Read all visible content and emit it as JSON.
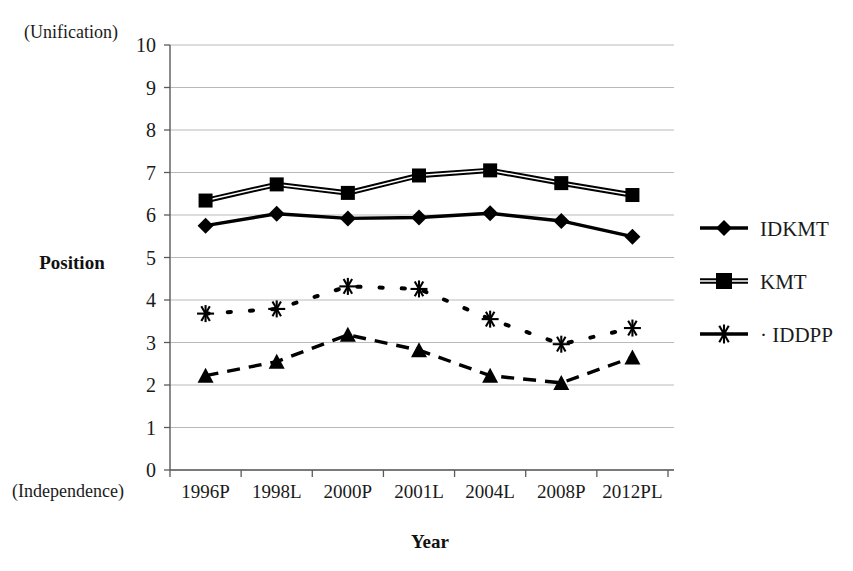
{
  "chart_data": {
    "type": "line",
    "title": "",
    "xlabel": "Year",
    "ylabel": "Position",
    "ylim": [
      0,
      10
    ],
    "ytick_step": 1,
    "grid": true,
    "legend_position": "right",
    "top_axis_note": "(Unification)",
    "bottom_axis_note": "(Independence)",
    "categories": [
      "1996P",
      "1998L",
      "2000P",
      "2001L",
      "2004L",
      "2008P",
      "2012PL"
    ],
    "yticks": [
      "0",
      "1",
      "2",
      "3",
      "4",
      "5",
      "6",
      "7",
      "8",
      "9",
      "10"
    ],
    "series": [
      {
        "name": "KMT",
        "marker": "square",
        "linestyle": "double-solid",
        "values": [
          6.34,
          6.72,
          6.52,
          6.93,
          7.05,
          6.75,
          6.47
        ]
      },
      {
        "name": "IDKMT",
        "marker": "diamond",
        "linestyle": "solid",
        "values": [
          5.75,
          6.03,
          5.92,
          5.94,
          6.04,
          5.86,
          5.49
        ]
      },
      {
        "name": "IDDPP",
        "marker": "star",
        "linestyle": "dotted",
        "values": [
          3.68,
          3.79,
          4.32,
          4.26,
          3.55,
          2.96,
          3.34
        ]
      },
      {
        "name": "DPP",
        "marker": "triangle",
        "linestyle": "dashed",
        "values": [
          2.22,
          2.55,
          3.18,
          2.82,
          2.22,
          2.05,
          2.65
        ]
      }
    ],
    "legend_entries": [
      {
        "label": "IDKMT",
        "marker": "diamond",
        "linestyle": "solid"
      },
      {
        "label": "KMT",
        "marker": "square",
        "linestyle": "double-solid"
      },
      {
        "label": "IDDPP",
        "marker": "star",
        "linestyle": "dotted"
      }
    ]
  }
}
